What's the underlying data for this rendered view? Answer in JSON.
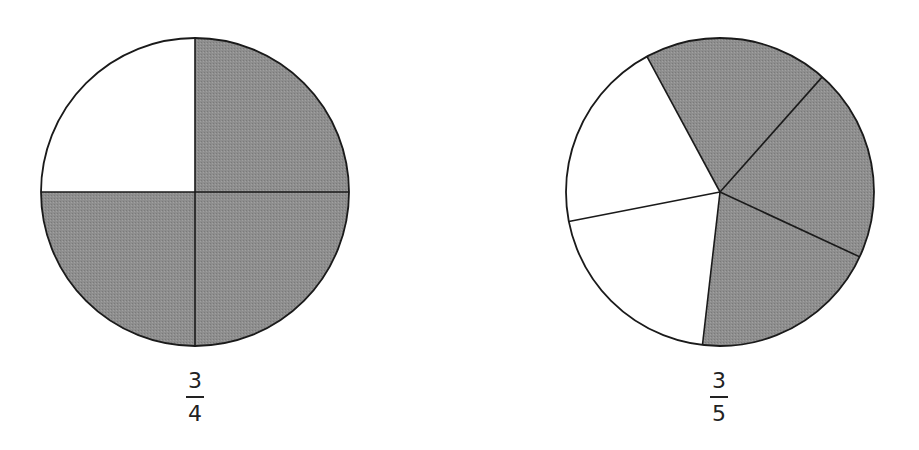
{
  "diagrams": [
    {
      "name": "three-quarters-pie",
      "parts": 4,
      "shaded": 3,
      "label": {
        "numerator": "3",
        "denominator": "4"
      },
      "center": [
        195,
        192
      ],
      "radius": 154,
      "divider_points": [
        [
          195,
          38
        ],
        [
          349,
          192
        ],
        [
          195,
          346
        ],
        [
          41,
          192
        ]
      ],
      "shaded_sectors": [
        0,
        1,
        2
      ]
    },
    {
      "name": "three-fifths-pie",
      "parts": 5,
      "shaded": 3,
      "label": {
        "numerator": "3",
        "denominator": "5"
      },
      "center": [
        720,
        192
      ],
      "radius": 154,
      "divider_points": [
        [
          645,
          53
        ],
        [
          823,
          76
        ],
        [
          860,
          257
        ],
        [
          702,
          349
        ],
        [
          566,
          222
        ]
      ],
      "shaded_sectors": [
        0,
        1,
        2
      ]
    }
  ],
  "colors": {
    "shade": "#8c8c8c",
    "stroke": "#1a1a1a",
    "background": "#ffffff"
  }
}
